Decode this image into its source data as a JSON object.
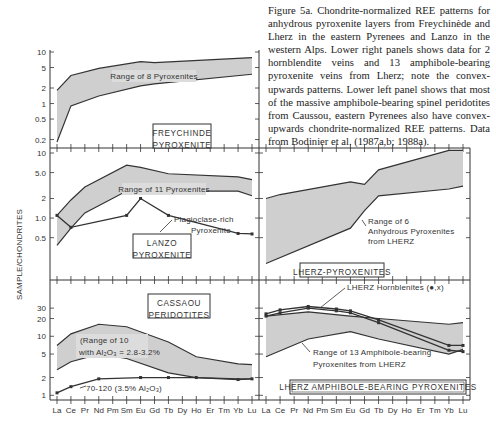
{
  "caption": "Figure 5a.  Chondrite-normalized REE patterns for anhydrous pyroxenite layers from Freychinède and Lherz in the eastern Pyrenees and Lanzo in the western Alps.  Lower right panels shows data for 2 hornblendite veins and 13 amphibole-bearing pyroxenite veins from Lherz; note the convex-upwards patterns.  Lower left panel shows that most of the massive amphibole-bearing spinel peridotites from Caussou, eastern Pyrenees also have convex-upwards chondrite-normalized REE patterns. Data from Bodinier et al. (1987a,b; 1988a).",
  "ylabel": "SAMPLE/CHONDRITES",
  "elements": [
    "La",
    "Ce",
    "Pr",
    "Nd",
    "Pm",
    "Sm",
    "Eu",
    "Gd",
    "Tb",
    "Dy",
    "Ho",
    "Er",
    "Tm",
    "Yb",
    "Lu"
  ],
  "colors": {
    "fill": "#cfcfcf",
    "line": "#333333"
  },
  "chart_data": [
    {
      "type": "area",
      "panel": "top-left",
      "title": "FREYCHINDE PYROXENITE",
      "annotation": "Range of 8 Pyroxenites",
      "yticks": [
        "10",
        "5",
        "2",
        "1",
        "0.5",
        "0.2"
      ],
      "ylim": [
        0.15,
        10
      ],
      "scale": "log",
      "series": [
        {
          "name": "upper bound",
          "x": [
            "La",
            "Ce",
            "Nd",
            "Eu",
            "Gd",
            "Lu"
          ],
          "values": [
            1.8,
            3.5,
            4.8,
            6.5,
            6.2,
            7.8
          ]
        },
        {
          "name": "lower bound",
          "x": [
            "La",
            "Ce",
            "Nd",
            "Eu",
            "Gd",
            "Lu"
          ],
          "values": [
            0.18,
            0.9,
            1.4,
            2.2,
            2.4,
            3.7
          ]
        }
      ]
    },
    {
      "type": "area",
      "panel": "middle-left",
      "title": "LANZO PYROXENITE",
      "annotation": "Range of 11 Pyroxenites",
      "yticks": [
        "10",
        "5.0",
        "2",
        "1.0",
        "0.5"
      ],
      "ylim": [
        0.12,
        10
      ],
      "scale": "log",
      "series": [
        {
          "name": "upper bound",
          "x": [
            "La",
            "Ce",
            "Pr",
            "Sm",
            "Eu",
            "Tb",
            "Yb",
            "Lu"
          ],
          "values": [
            1.1,
            1.9,
            3.0,
            6.5,
            6.0,
            4.8,
            4.3,
            3.9
          ]
        },
        {
          "name": "lower bound",
          "x": [
            "La",
            "Ce",
            "Pr",
            "Sm",
            "Eu",
            "Tb",
            "Yb",
            "Lu"
          ],
          "values": [
            0.38,
            0.7,
            1.2,
            2.6,
            2.7,
            2.6,
            2.6,
            2.2
          ]
        },
        {
          "name": "Plagioclase-rich Pyroxenite",
          "x": [
            "La",
            "Ce",
            "Sm",
            "Eu",
            "Tb",
            "Yb",
            "Lu"
          ],
          "values": [
            1.1,
            0.72,
            1.1,
            2.0,
            1.1,
            0.58,
            0.57
          ]
        }
      ]
    },
    {
      "type": "area",
      "panel": "bottom-left",
      "title": "CASSAOU PERIDOTITES",
      "annotation": "Range of 10 with Al2O3 = 2.8-3.2%",
      "yticks": [
        "30",
        "20",
        "10",
        "5",
        "2",
        "1"
      ],
      "ylim": [
        0.9,
        80
      ],
      "scale": "log",
      "series": [
        {
          "name": "upper bound",
          "x": [
            "La",
            "Ce",
            "Nd",
            "Sm",
            "Tb",
            "Ho",
            "Yb",
            "Lu"
          ],
          "values": [
            7,
            11,
            16,
            14.5,
            8,
            4.5,
            3.4,
            3.3
          ]
        },
        {
          "name": "lower bound",
          "x": [
            "La",
            "Ce",
            "Nd",
            "Sm",
            "Tb",
            "Ho",
            "Yb",
            "Lu"
          ],
          "values": [
            2.7,
            3.7,
            5,
            4.2,
            2.4,
            2.0,
            1.9,
            1.9
          ]
        },
        {
          "name": "70-120 (3.5% Al2O3)",
          "x": [
            "La",
            "Ce",
            "Nd",
            "Eu",
            "Tb",
            "Ho",
            "Yb",
            "Lu"
          ],
          "values": [
            1.1,
            1.4,
            1.9,
            2.0,
            2.0,
            2.0,
            1.85,
            1.9
          ]
        }
      ]
    },
    {
      "type": "area",
      "panel": "middle-right",
      "title": "LHERZ-PYROXENITES",
      "annotation": "Range of 6 Anhydrous Pyroxenites from LHERZ",
      "ylim": [
        0.12,
        10
      ],
      "scale": "log",
      "series": [
        {
          "name": "upper bound",
          "x": [
            "La",
            "Ce",
            "Eu",
            "Gd",
            "Tb",
            "Yb",
            "Lu"
          ],
          "values": [
            2.0,
            2.3,
            3.6,
            3.3,
            5.5,
            11,
            11
          ]
        },
        {
          "name": "lower bound",
          "x": [
            "La",
            "Eu",
            "Gd",
            "Tb",
            "Yb",
            "Lu"
          ],
          "values": [
            0.2,
            0.7,
            1.3,
            2.2,
            2.8,
            3.1
          ]
        }
      ]
    },
    {
      "type": "line",
      "panel": "bottom-right",
      "title": "LHERZ AMPHIBOLE-BEARING PYROXENITES",
      "annotation": "Range of 13 Amphibole-bearing Pyroxenites from LHERZ",
      "annotation2": "LHERZ Hornblenites (●,x)",
      "ylim": [
        0.9,
        80
      ],
      "scale": "log",
      "series": [
        {
          "name": "range upper",
          "x": [
            "La",
            "Nd",
            "Eu",
            "Tb",
            "Yb",
            "Lu"
          ],
          "values": [
            22,
            26,
            22,
            20,
            16,
            17
          ]
        },
        {
          "name": "range lower",
          "x": [
            "La",
            "Nd",
            "Eu",
            "Tb",
            "Yb",
            "Lu"
          ],
          "values": [
            4.5,
            9,
            12,
            9,
            5,
            6
          ]
        },
        {
          "name": "Hornblenite ●",
          "x": [
            "La",
            "Ce",
            "Nd",
            "Sm",
            "Eu",
            "Tb",
            "Yb",
            "Lu"
          ],
          "values": [
            24,
            28,
            32,
            29,
            27,
            19,
            7,
            7
          ]
        },
        {
          "name": "Hornblenite x",
          "x": [
            "La",
            "Ce",
            "Nd",
            "Sm",
            "Eu",
            "Tb",
            "Yb",
            "Lu"
          ],
          "values": [
            22,
            25,
            30,
            27,
            25,
            17,
            5.8,
            5.5
          ]
        }
      ]
    }
  ]
}
